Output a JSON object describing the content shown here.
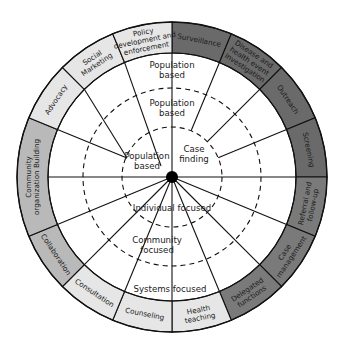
{
  "diagram": {
    "center": {
      "x": 172,
      "y": 177
    },
    "radii": {
      "outer": 155,
      "ring_inner": 124,
      "dashed_outer": 89,
      "dashed_inner": 50,
      "hub": 6
    },
    "colors": {
      "light": "#e6e6e6",
      "medium": "#b9b9b9",
      "dark": "#7a7a7a",
      "darkest": "#6a6a6a",
      "line": "#111111"
    },
    "segments": [
      {
        "id": "surveillance",
        "lines": [
          "Surveillance"
        ],
        "start": 0,
        "end": 22.5,
        "shade": "darkest"
      },
      {
        "id": "disease-investigation",
        "lines": [
          "Disease and",
          "health event",
          "investigation"
        ],
        "start": 22.5,
        "end": 45,
        "shade": "darkest"
      },
      {
        "id": "outreach",
        "lines": [
          "Outreach"
        ],
        "start": 45,
        "end": 67.5,
        "shade": "darkest"
      },
      {
        "id": "screening",
        "lines": [
          "Screening"
        ],
        "start": 67.5,
        "end": 90,
        "shade": "darkest"
      },
      {
        "id": "referral",
        "lines": [
          "Referral and",
          "follow-up"
        ],
        "start": 90,
        "end": 112.5,
        "shade": "dark"
      },
      {
        "id": "case-management",
        "lines": [
          "Case",
          "management"
        ],
        "start": 112.5,
        "end": 135,
        "shade": "dark"
      },
      {
        "id": "delegated-functions",
        "lines": [
          "Delegated",
          "functions"
        ],
        "start": 135,
        "end": 157.5,
        "shade": "dark"
      },
      {
        "id": "health-teaching",
        "lines": [
          "Health",
          "teaching"
        ],
        "start": 157.5,
        "end": 180,
        "shade": "light"
      },
      {
        "id": "counseling",
        "lines": [
          "Counseling"
        ],
        "start": 180,
        "end": 202.5,
        "shade": "light"
      },
      {
        "id": "consultation",
        "lines": [
          "Consultation"
        ],
        "start": 202.5,
        "end": 225,
        "shade": "light"
      },
      {
        "id": "collaboration",
        "lines": [
          "Collaboration"
        ],
        "start": 225,
        "end": 247.5,
        "shade": "medium"
      },
      {
        "id": "community-organization-building",
        "lines": [
          "Community",
          "organization Building"
        ],
        "start": 247.5,
        "end": 292.5,
        "shade": "medium"
      },
      {
        "id": "advocacy",
        "lines": [
          "Advocacy"
        ],
        "start": 292.5,
        "end": 315,
        "shade": "light"
      },
      {
        "id": "social-marketing",
        "lines": [
          "Social",
          "Marketing"
        ],
        "start": 315,
        "end": 337.5,
        "shade": "light"
      },
      {
        "id": "policy-development",
        "lines": [
          "Policy",
          "development and",
          "enforcement"
        ],
        "start": 337.5,
        "end": 360,
        "shade": "light"
      }
    ],
    "spokes": [
      {
        "from_angle": 0,
        "to": "center"
      },
      {
        "from_angle": 22.5,
        "to_radius": 50
      },
      {
        "from_angle": 45,
        "to_radius": 50
      },
      {
        "from_angle": 67.5,
        "to_radius": 50
      },
      {
        "from_angle": 90,
        "to": "center"
      },
      {
        "from_angle": 112.5,
        "to": "center"
      },
      {
        "from_angle": 135,
        "to": "center"
      },
      {
        "from_angle": 157.5,
        "to": "center"
      },
      {
        "from_angle": 180,
        "to": "center"
      },
      {
        "from_angle": 202.5,
        "to": "center"
      },
      {
        "from_angle": 225,
        "to": "center"
      },
      {
        "from_angle": 247.5,
        "to": "center"
      },
      {
        "from_angle": 270,
        "to": "center"
      },
      {
        "from_angle": 292.5,
        "to_point": [
          127,
          158
        ]
      },
      {
        "from_angle": 315,
        "to_point": [
          127,
          158
        ]
      },
      {
        "from_angle": 337.5,
        "to_point": [
          161,
          166
        ]
      }
    ],
    "inner_labels": [
      {
        "id": "population-based-outer",
        "lines": [
          "Population",
          "based"
        ],
        "x": 172,
        "y": 70
      },
      {
        "id": "population-based-middle",
        "lines": [
          "Population",
          "based"
        ],
        "x": 172,
        "y": 108
      },
      {
        "id": "population-based-inner",
        "lines": [
          "Population",
          "based"
        ],
        "x": 147,
        "y": 161
      },
      {
        "id": "case-finding",
        "lines": [
          "Case",
          "finding"
        ],
        "x": 194,
        "y": 154
      },
      {
        "id": "individual-focused",
        "lines": [
          "Individual focused"
        ],
        "x": 172,
        "y": 208
      },
      {
        "id": "community-focused",
        "lines": [
          "Community",
          "focused"
        ],
        "x": 157,
        "y": 245
      },
      {
        "id": "systems-focused",
        "lines": [
          "Systems focused"
        ],
        "x": 170,
        "y": 289
      }
    ]
  }
}
